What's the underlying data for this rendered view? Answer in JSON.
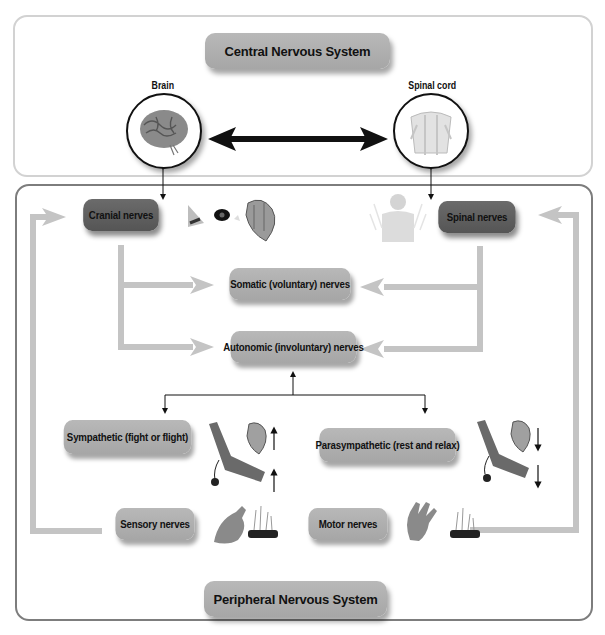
{
  "cns": {
    "title": "Central Nervous System",
    "brain_label": "Brain",
    "spinal_cord_label": "Spinal cord"
  },
  "pns": {
    "title": "Peripheral Nervous System",
    "cranial": "Cranial nerves",
    "spinal": "Spinal nerves",
    "somatic": "Somatic (voluntary) nerves",
    "autonomic": "Autonomic (involuntary) nerves",
    "sympathetic": "Sympathetic (fight or flight)",
    "parasympathetic": "Parasympathetic (rest and relax)",
    "sensory": "Sensory nerves",
    "motor": "Motor nerves"
  },
  "icons": {
    "brain": "brain-illustration",
    "spinal_cord": "spinal-cord-illustration",
    "nose": "nose-illustration",
    "eye": "eye-illustration",
    "heart": "heart-illustration",
    "torso": "torso-nerves-illustration",
    "arm_bp_cuff": "arm-blood-pressure-illustration",
    "hand": "hand-illustration",
    "skin_hair": "skin-hair-follicle-illustration",
    "increase_arrow": "up-arrow",
    "decrease_arrow": "down-arrow"
  },
  "colors": {
    "pill_light": "#b0b0b0",
    "pill_dark": "#5e5e5e",
    "flow_arrow": "#c4c4c4",
    "cns_border": "#d2d2d2",
    "pns_border": "#7d7d7d"
  }
}
